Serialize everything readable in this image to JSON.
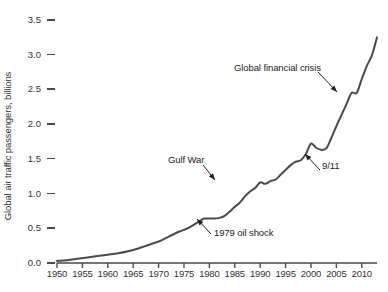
{
  "chart_data": {
    "type": "line",
    "title": "",
    "xlabel": "",
    "ylabel": "Global air traffic passengers, billions",
    "xlim": [
      1950,
      2013
    ],
    "ylim": [
      0.0,
      3.5
    ],
    "grid": false,
    "legend": null,
    "xticks": [
      1950,
      1955,
      1960,
      1965,
      1970,
      1975,
      1980,
      1985,
      1990,
      1995,
      2000,
      2005,
      2010
    ],
    "xtick_labels": [
      "1950",
      "1955",
      "1960",
      "1965",
      "1970",
      "1975",
      "1980",
      "1985",
      "1990",
      "1995",
      "2000",
      "2005",
      "2010"
    ],
    "yticks": [
      0.0,
      0.5,
      1.0,
      1.5,
      2.0,
      2.5,
      3.0,
      3.5
    ],
    "ytick_labels": [
      "0.0",
      "0.5",
      "1.0",
      "1.5",
      "2.0",
      "2.5",
      "3.0",
      "3.5"
    ],
    "line_color": "#4a4a4a",
    "series": [
      {
        "name": "Global air traffic passengers",
        "x": [
          1950,
          1952,
          1954,
          1956,
          1958,
          1960,
          1962,
          1964,
          1966,
          1968,
          1970,
          1972,
          1974,
          1976,
          1978,
          1979,
          1980,
          1981,
          1982,
          1983,
          1984,
          1985,
          1986,
          1987,
          1988,
          1989,
          1990,
          1991,
          1992,
          1993,
          1994,
          1995,
          1996,
          1997,
          1998,
          1999,
          2000,
          2001,
          2002,
          2003,
          2004,
          2005,
          2006,
          2007,
          2008,
          2009,
          2010,
          2011,
          2012,
          2013
        ],
        "values": [
          0.03,
          0.04,
          0.06,
          0.08,
          0.1,
          0.12,
          0.14,
          0.17,
          0.21,
          0.26,
          0.31,
          0.38,
          0.45,
          0.51,
          0.6,
          0.64,
          0.64,
          0.64,
          0.65,
          0.68,
          0.74,
          0.81,
          0.87,
          0.96,
          1.03,
          1.08,
          1.16,
          1.14,
          1.18,
          1.2,
          1.27,
          1.34,
          1.41,
          1.46,
          1.48,
          1.57,
          1.72,
          1.66,
          1.63,
          1.65,
          1.8,
          1.97,
          2.13,
          2.29,
          2.45,
          2.45,
          2.65,
          2.84,
          2.99,
          3.25
        ],
        "annotations": [
          {
            "label": "1979 oil shock",
            "year": 1979,
            "value": 0.64
          },
          {
            "label": "Gulf War",
            "year": 1991,
            "value": 1.14
          },
          {
            "label": "9/11",
            "year": 2001,
            "value": 1.66
          },
          {
            "label": "Global financial crisis",
            "year": 2009,
            "value": 2.45
          }
        ]
      }
    ]
  },
  "annotations": {
    "oil_shock": "1979 oil shock",
    "gulf_war": "Gulf War",
    "nine_eleven": "9/11",
    "financial_crisis": "Global financial crisis"
  }
}
